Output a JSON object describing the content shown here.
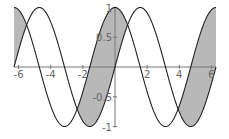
{
  "chart_data": {
    "type": "line",
    "title": "",
    "xlabel": "",
    "ylabel": "",
    "xlim": [
      -6.2832,
      6.2832
    ],
    "ylim": [
      -1,
      1
    ],
    "grid": false,
    "legend": null,
    "series": [
      {
        "name": "sin(x)",
        "expr": "sin",
        "color": "#222222"
      },
      {
        "name": "cos(x)",
        "expr": "cos",
        "color": "#222222"
      }
    ],
    "fill_between": {
      "where": "cos(x) > sin(x)",
      "color": "#b8b8b8",
      "intervals": [
        [
          -6.2832,
          -5.4978
        ],
        [
          -2.3562,
          0.7854
        ],
        [
          3.927,
          6.2832
        ]
      ]
    },
    "x_ticks": [
      {
        "value": -6,
        "label": "-6"
      },
      {
        "value": -4,
        "label": "-4"
      },
      {
        "value": -2,
        "label": "-2"
      },
      {
        "value": 2,
        "label": "2"
      },
      {
        "value": 4,
        "label": "4"
      },
      {
        "value": 6,
        "label": "6"
      }
    ],
    "y_ticks": [
      {
        "value": 1,
        "label": "1"
      },
      {
        "value": 0.5,
        "label": "0.5"
      },
      {
        "value": -0.5,
        "label": "-0.5"
      },
      {
        "value": -1,
        "label": "-1"
      }
    ]
  },
  "layout": {
    "origin_x": 115,
    "origin_y": 67,
    "px_per_x": 16.07,
    "px_per_y": 59.5
  }
}
